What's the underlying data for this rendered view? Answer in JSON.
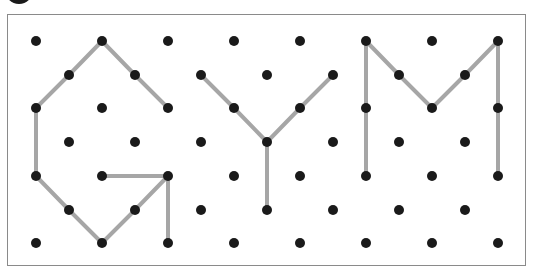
{
  "puzzle": {
    "word": "GYM",
    "letters": [
      "G",
      "Y",
      "M"
    ],
    "grid": {
      "columns_x": [
        36,
        69,
        102,
        135,
        168,
        201,
        234,
        267,
        300,
        333,
        366,
        399,
        432,
        465,
        498
      ],
      "rows_y": [
        41,
        75,
        108,
        142,
        176,
        210,
        243
      ],
      "pattern": "checkerboard (dots where row+col is even)"
    },
    "colors": {
      "dot": "#1a1a1a",
      "line": "#a6a6a6",
      "frame": "#8a8a8a"
    },
    "segments": [
      {
        "letter": "G",
        "points": [
          [
            102,
            41
          ],
          [
            69,
            75
          ],
          [
            36,
            108
          ],
          [
            36,
            176
          ],
          [
            69,
            210
          ],
          [
            102,
            243
          ],
          [
            135,
            210
          ],
          [
            168,
            176
          ]
        ]
      },
      {
        "letter": "G",
        "points": [
          [
            102,
            41
          ],
          [
            135,
            75
          ],
          [
            168,
            108
          ]
        ]
      },
      {
        "letter": "G",
        "points": [
          [
            102,
            176
          ],
          [
            168,
            176
          ]
        ]
      },
      {
        "letter": "G",
        "points": [
          [
            168,
            176
          ],
          [
            168,
            243
          ]
        ]
      },
      {
        "letter": "Y",
        "points": [
          [
            201,
            75
          ],
          [
            234,
            108
          ],
          [
            267,
            142
          ]
        ]
      },
      {
        "letter": "Y",
        "points": [
          [
            333,
            75
          ],
          [
            300,
            108
          ],
          [
            267,
            142
          ]
        ]
      },
      {
        "letter": "Y",
        "points": [
          [
            267,
            142
          ],
          [
            267,
            210
          ]
        ]
      },
      {
        "letter": "M",
        "points": [
          [
            366,
            176
          ],
          [
            366,
            41
          ],
          [
            399,
            75
          ],
          [
            432,
            108
          ],
          [
            465,
            75
          ],
          [
            498,
            41
          ],
          [
            498,
            176
          ]
        ]
      }
    ]
  }
}
